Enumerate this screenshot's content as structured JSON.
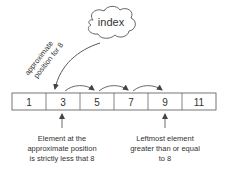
{
  "cloud": {
    "label": "index"
  },
  "pointer_label": {
    "line1": "approximate",
    "line2": "position for 8"
  },
  "array": {
    "cells": [
      "1",
      "3",
      "5",
      "7",
      "9",
      "11"
    ]
  },
  "annotations": {
    "left": {
      "lines": [
        "Element at the",
        "approximate position",
        "is strictly less that 8"
      ]
    },
    "right": {
      "lines": [
        "Leftmost element",
        "greater than or equal",
        "to 8"
      ]
    }
  },
  "colors": {
    "stroke": "#555555",
    "text": "#333333",
    "background": "#ffffff"
  }
}
